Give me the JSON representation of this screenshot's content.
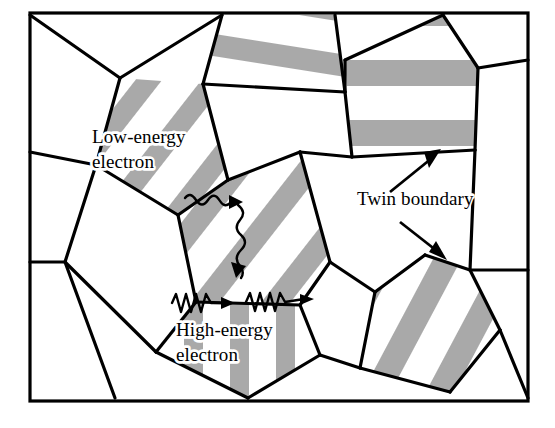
{
  "figure": {
    "frame": {
      "x": 30,
      "y": 13,
      "width": 498,
      "height": 388,
      "stroke": "#000000"
    },
    "colors": {
      "background": "#ffffff",
      "grain_boundary": "#000000",
      "twin_stripe": "#a9a9a9",
      "label": "#000000",
      "label_halo": "#ffffff"
    },
    "labels": [
      {
        "id": "low-energy-electron",
        "line1": "Low-energy",
        "line2": "electron",
        "x": 92,
        "y": 143
      },
      {
        "id": "high-energy-electron",
        "line1": "High-energy",
        "line2": "electron",
        "x": 176,
        "y": 336
      },
      {
        "id": "twin-boundary",
        "line1": "Twin boundary",
        "line2": "",
        "x": 357,
        "y": 205
      }
    ],
    "annotations": [
      {
        "id": "twin-boundary-arrow-upper",
        "description": "arrow pointing up-right to twin stripe in upper-right grain",
        "from": [
          390,
          192
        ],
        "to": [
          437,
          152
        ]
      },
      {
        "id": "twin-boundary-arrow-lower",
        "description": "arrow pointing down-right to twin stripe in lower-right grain",
        "from": [
          400,
          222
        ],
        "to": [
          443,
          258
        ]
      }
    ],
    "electrons": [
      {
        "id": "low-energy-electron-trajectory",
        "description": "wavy scattered path, deflects at twin boundary",
        "scattered": true
      },
      {
        "id": "high-energy-electron-trajectory-1",
        "description": "zigzag sawtooth arrow travelling straight right",
        "scattered": false
      },
      {
        "id": "high-energy-electron-trajectory-2",
        "description": "zigzag sawtooth arrow travelling straight right",
        "scattered": false
      }
    ],
    "grains": [
      {
        "id": "grain-top-left",
        "twinned": false,
        "stripe_angle": null
      },
      {
        "id": "grain-top-center",
        "twinned": true,
        "stripe_angle": 9
      },
      {
        "id": "grain-top-right",
        "twinned": false,
        "stripe_angle": null
      },
      {
        "id": "grain-upper-right",
        "twinned": true,
        "stripe_angle": 0
      },
      {
        "id": "grain-left-upper",
        "twinned": true,
        "stripe_angle": 52
      },
      {
        "id": "grain-left-middle",
        "twinned": false,
        "stripe_angle": null
      },
      {
        "id": "grain-left-lower",
        "twinned": false,
        "stripe_angle": null
      },
      {
        "id": "grain-center",
        "twinned": true,
        "stripe_angle": 52
      },
      {
        "id": "grain-center-right",
        "twinned": false,
        "stripe_angle": null
      },
      {
        "id": "grain-bottom-center",
        "twinned": true,
        "stripe_angle": 90
      },
      {
        "id": "grain-bottom-left",
        "twinned": false,
        "stripe_angle": null
      },
      {
        "id": "grain-bottom-right",
        "twinned": true,
        "stripe_angle": 62
      },
      {
        "id": "grain-right-edge",
        "twinned": false,
        "stripe_angle": null
      },
      {
        "id": "grain-bottom-strip",
        "twinned": false,
        "stripe_angle": null
      }
    ]
  }
}
